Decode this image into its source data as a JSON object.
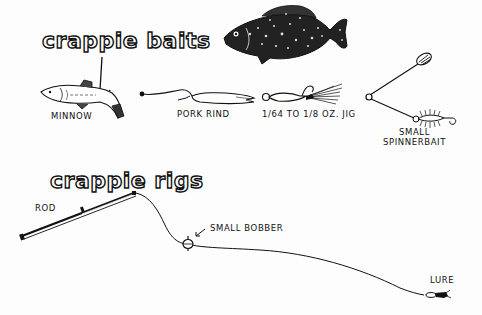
{
  "sections": {
    "baits": {
      "title": "crappie baits",
      "items": [
        {
          "name": "minnow",
          "label": "MINNOW"
        },
        {
          "name": "pork-rind",
          "label": "PORK RIND"
        },
        {
          "name": "jig",
          "label": "1/64 TO 1/8 OZ. JIG"
        },
        {
          "name": "spinnerbait",
          "label_line1": "SMALL",
          "label_line2": "SPINNERBAIT"
        }
      ]
    },
    "rigs": {
      "title": "crappie rigs",
      "parts": [
        {
          "name": "rod",
          "label": "ROD"
        },
        {
          "name": "bobber",
          "label": "SMALL BOBBER"
        },
        {
          "name": "lure",
          "label": "LURE"
        }
      ]
    }
  },
  "colors": {
    "ink": "#111111",
    "paper": "#fdfdfd"
  }
}
